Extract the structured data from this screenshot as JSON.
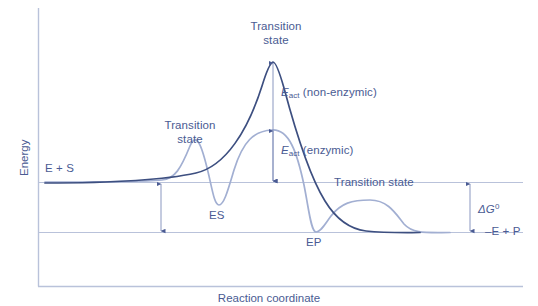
{
  "figure": {
    "type": "energy-reaction-coordinate-diagram",
    "colors": {
      "text": "#4a5b93",
      "curve_non_enzymic": "#3d4f80",
      "curve_enzymic": "#a2afd2",
      "reference_line": "#b9c2da",
      "axis": "#b9c2da",
      "arrow": "#4a5b93",
      "background": "#ffffff"
    },
    "axes": {
      "ylabel": "Energy",
      "xlabel": "Reaction coordinate"
    },
    "reference_lines": [
      {
        "name": "reactant-level",
        "label": "E + S",
        "y_px": 182
      },
      {
        "name": "product-level",
        "label": "–E + P",
        "y_px": 232
      }
    ],
    "labels": {
      "reactants": "E + S",
      "products": "–E + P",
      "es_complex": "ES",
      "ep_complex": "EP",
      "transition_state_1": "Transition\nstate",
      "transition_state_1_line1": "Transition",
      "transition_state_1_line2": "state",
      "transition_state_2_line1": "Transition",
      "transition_state_2_line2": "state",
      "transition_state_3": "Transition state",
      "eact_non_enzymic_symbol": "E",
      "eact_non_enzymic_sub": "act",
      "eact_non_enzymic_rest": " (non-enzymic)",
      "eact_enzymic_symbol": "E",
      "eact_enzymic_sub": "act",
      "eact_enzymic_rest": " (enzymic)",
      "delta_g_symbol": "ΔG",
      "delta_g_sup": "0"
    },
    "annotations": [
      {
        "name": "eact-non-enzymic-arrow",
        "kind": "down-arrow",
        "from_y": 62,
        "to_y": 182,
        "x": 273
      },
      {
        "name": "eact-enzymic-arrow",
        "kind": "down-arrow",
        "from_y": 130,
        "to_y": 182,
        "x": 273
      },
      {
        "name": "binding-energy-arrow",
        "kind": "double-arrow",
        "from_y": 182,
        "to_y": 232,
        "x": 161
      },
      {
        "name": "delta-g-arrow",
        "kind": "double-arrow",
        "from_y": 182,
        "to_y": 232,
        "x": 470
      }
    ],
    "curves": [
      {
        "name": "non-enzymic-pathway",
        "color": "#3d4f80",
        "description": "Single large activation barrier from E + S to –E + P"
      },
      {
        "name": "enzymic-pathway",
        "color": "#a2afd2",
        "description": "Three smaller barriers with ES and EP intermediate wells"
      }
    ]
  }
}
